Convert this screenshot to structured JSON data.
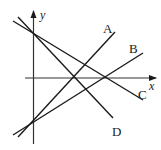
{
  "diagram": {
    "type": "coordinate-plane-lines",
    "axes": {
      "x_label": "x",
      "y_label": "y"
    },
    "lines": [
      {
        "label": "A",
        "slope_sign": "positive",
        "passes_through": "negative y-intercept"
      },
      {
        "label": "B",
        "slope_sign": "positive",
        "passes_through": "negative y-intercept"
      },
      {
        "label": "C",
        "slope_sign": "negative",
        "passes_through": "positive y-intercept"
      },
      {
        "label": "D",
        "slope_sign": "negative",
        "passes_through": "positive y-intercept"
      }
    ],
    "colors": {
      "stroke": "#1a1a1a",
      "background": "#ffffff"
    }
  }
}
